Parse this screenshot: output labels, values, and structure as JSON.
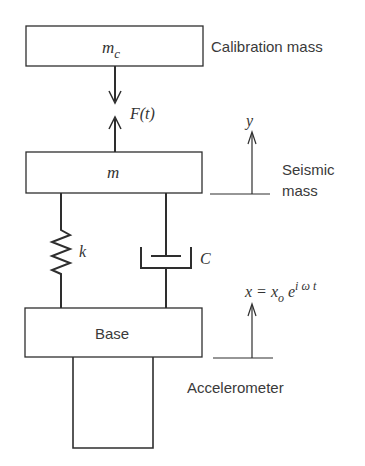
{
  "labels": {
    "calibration_mass_symbol": "m",
    "calibration_mass_sub": "c",
    "calibration_mass": "Calibration mass",
    "force": "F(t)",
    "y_disp": "y",
    "seismic_mass_symbol": "m",
    "seismic_mass_line1": "Seismic",
    "seismic_mass_line2": "mass",
    "spring": "k",
    "damper": "C",
    "x_eq_lhs": "x = x",
    "x_eq_sub": "o",
    "x_eq_e": " e",
    "x_eq_sup": "i ω t",
    "base": "Base",
    "accelerometer": "Accelerometer"
  },
  "colors": {
    "stroke": "#2e2e2e",
    "text": "#3a3a3a"
  }
}
